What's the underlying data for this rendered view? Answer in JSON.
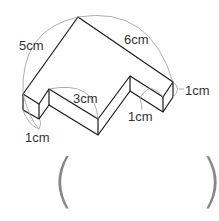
{
  "diagram": {
    "type": "3d-prism-figure",
    "labels": {
      "top_left_edge": "5cm",
      "top_right_edge": "6cm",
      "notch_edge": "3cm",
      "left_height": "1cm",
      "right_height": "1cm",
      "right_depth": "1cm"
    },
    "answer_blank": {
      "left_paren": "(",
      "right_paren": ")"
    }
  }
}
